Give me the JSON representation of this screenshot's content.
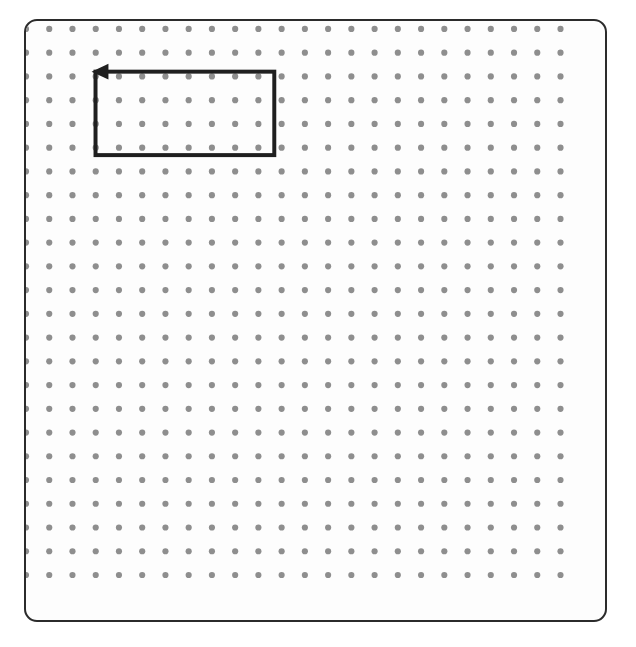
{
  "app": {
    "name": "dot-grid-canvas",
    "background_color": "#ffffff"
  },
  "canvas": {
    "name": "canvas-frame",
    "x": 24,
    "y": 19,
    "width": 583,
    "height": 603,
    "corner_radius": 13,
    "border_color": "#2b2b2b",
    "border_width": 2,
    "fill_color": "#fdfdfd"
  },
  "grid": {
    "name": "dot-grid",
    "columns": 24,
    "rows": 24,
    "origin_x": 24,
    "origin_y": 27,
    "spacing_x": 23.4,
    "spacing_y": 23.9,
    "dot_radius": 3.1,
    "dot_color": "#8e8e8e"
  },
  "shapes": [
    {
      "name": "rectangle-path",
      "type": "rectangle",
      "stroke_color": "#1f1f1f",
      "stroke_width": 4,
      "fill": "none",
      "grid_col_start": 3,
      "grid_col_end": 11,
      "grid_row_start": 2,
      "grid_row_end": 5,
      "x": 70,
      "y": 51,
      "width": 180,
      "height": 84,
      "closed": true
    }
  ],
  "arrow": {
    "name": "arrowhead-left",
    "type": "arrowhead",
    "direction": "left",
    "tip_x": 66,
    "tip_y": 51,
    "length": 17,
    "half_width": 8,
    "color": "#1f1f1f"
  },
  "labels": {
    "canvas_title": "",
    "status": ""
  }
}
